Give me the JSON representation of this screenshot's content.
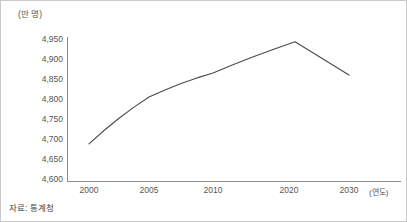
{
  "chart_data": {
    "type": "line",
    "title": "",
    "subtitle": "",
    "xlabel": "(연도)",
    "ylabel": "(만 명)",
    "x": [
      2000,
      2005,
      2010,
      2021,
      2030
    ],
    "categories": [
      "2000",
      "2005",
      "2010",
      "2020",
      "2030"
    ],
    "values": [
      4688,
      4805,
      4865,
      4943,
      4860
    ],
    "series": [
      {
        "name": "총인구",
        "values": [
          4688,
          4805,
          4865,
          4943,
          4860
        ]
      }
    ],
    "annotations": [],
    "legend": [],
    "legend_position": "none",
    "grid": false,
    "ylim": [
      4600,
      4950
    ],
    "ytick_labels": [
      "4,950",
      "4,900",
      "4,850",
      "4,800",
      "4,750",
      "4,700",
      "4,650",
      "4,600"
    ],
    "ytick_values": [
      4950,
      4900,
      4850,
      4800,
      4750,
      4700,
      4650,
      4600
    ],
    "xtick_labels": [
      "2000",
      "2005",
      "2010",
      "2020",
      "2030"
    ],
    "xtick_values": [
      2000,
      2005,
      2010,
      2020,
      2030
    ],
    "line_color": "#4a4a4a",
    "axis_color": "#8d8d8d",
    "text_color": "#555555"
  },
  "axis": {
    "y_unit": "(만 명)",
    "x_unit": "(연도)"
  },
  "footer": {
    "source": "자료: 통계청"
  }
}
